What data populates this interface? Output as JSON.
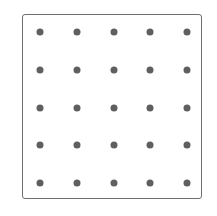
{
  "grid": {
    "rows": 5,
    "cols": 5,
    "x_positions": [
      40,
      77,
      114,
      150,
      187
    ],
    "y_positions": [
      32,
      70,
      108,
      145,
      183
    ],
    "dot_color": "#5f5f5f",
    "border_color": "#6e6e6e"
  }
}
